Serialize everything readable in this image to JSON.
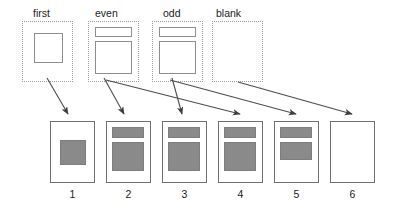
{
  "diagram": {
    "colors": {
      "block_fill": "#8a8a8a",
      "block_stroke": "#7d7d7d",
      "page_stroke": "#6f6f6f",
      "template_stroke": "#9a9a9a",
      "arrow": "#4d4d4d",
      "background": "#ffffff",
      "text": "#1a1a1a"
    },
    "templates": [
      {
        "id": "first",
        "label": "first",
        "label_x": 33,
        "label_y": 7,
        "box": {
          "x": 22,
          "y": 21,
          "w": 51,
          "h": 61
        },
        "has_header_bar": false,
        "body": {
          "x": 34,
          "y": 33,
          "w": 29,
          "h": 30
        }
      },
      {
        "id": "even",
        "label": "even",
        "label_x": 95,
        "label_y": 7,
        "box": {
          "x": 88,
          "y": 21,
          "w": 51,
          "h": 61
        },
        "has_header_bar": true,
        "header": {
          "x": 95,
          "y": 27,
          "w": 37,
          "h": 10
        },
        "body": {
          "x": 95,
          "y": 41,
          "w": 37,
          "h": 33
        }
      },
      {
        "id": "odd",
        "label": "odd",
        "label_x": 163,
        "label_y": 7,
        "box": {
          "x": 152,
          "y": 21,
          "w": 51,
          "h": 61
        },
        "has_header_bar": true,
        "header": {
          "x": 159,
          "y": 27,
          "w": 37,
          "h": 10
        },
        "body": {
          "x": 159,
          "y": 41,
          "w": 37,
          "h": 33
        }
      },
      {
        "id": "blank",
        "label": "blank",
        "label_x": 216,
        "label_y": 7,
        "box": {
          "x": 212,
          "y": 21,
          "w": 51,
          "h": 61
        },
        "has_header_bar": false,
        "body": null
      }
    ],
    "pages": [
      {
        "number": "1",
        "box": {
          "x": 50,
          "y": 121,
          "w": 45,
          "h": 62
        },
        "blocks": [
          {
            "x": 60,
            "y": 140,
            "w": 26,
            "h": 25
          }
        ]
      },
      {
        "number": "2",
        "box": {
          "x": 106,
          "y": 121,
          "w": 45,
          "h": 62
        },
        "blocks": [
          {
            "x": 112,
            "y": 127,
            "w": 32,
            "h": 11
          },
          {
            "x": 112,
            "y": 142,
            "w": 32,
            "h": 29
          }
        ]
      },
      {
        "number": "3",
        "box": {
          "x": 162,
          "y": 121,
          "w": 45,
          "h": 62
        },
        "blocks": [
          {
            "x": 168,
            "y": 127,
            "w": 32,
            "h": 11
          },
          {
            "x": 168,
            "y": 142,
            "w": 32,
            "h": 29
          }
        ]
      },
      {
        "number": "4",
        "box": {
          "x": 218,
          "y": 121,
          "w": 45,
          "h": 62
        },
        "blocks": [
          {
            "x": 224,
            "y": 127,
            "w": 32,
            "h": 11
          },
          {
            "x": 224,
            "y": 142,
            "w": 32,
            "h": 29
          }
        ]
      },
      {
        "number": "5",
        "box": {
          "x": 274,
          "y": 121,
          "w": 45,
          "h": 62
        },
        "blocks": [
          {
            "x": 280,
            "y": 127,
            "w": 32,
            "h": 11
          },
          {
            "x": 280,
            "y": 142,
            "w": 32,
            "h": 18
          }
        ]
      },
      {
        "number": "6",
        "box": {
          "x": 330,
          "y": 121,
          "w": 45,
          "h": 62
        },
        "blocks": []
      }
    ],
    "arrows": [
      {
        "id": "first-to-1",
        "from": "first",
        "to": "1",
        "x1": 47,
        "y1": 78,
        "x2": 68,
        "y2": 114
      },
      {
        "id": "even-to-2",
        "from": "even",
        "to": "2",
        "x1": 104,
        "y1": 78,
        "x2": 124,
        "y2": 114
      },
      {
        "id": "odd-to-3",
        "from": "odd",
        "to": "3",
        "x1": 172,
        "y1": 78,
        "x2": 182,
        "y2": 114
      },
      {
        "id": "even-to-4",
        "from": "even",
        "to": "4",
        "x1": 106,
        "y1": 80,
        "x2": 240,
        "y2": 114
      },
      {
        "id": "odd-to-5",
        "from": "odd",
        "to": "5",
        "x1": 170,
        "y1": 80,
        "x2": 296,
        "y2": 114
      },
      {
        "id": "blank-to-6",
        "from": "blank",
        "to": "6",
        "x1": 238,
        "y1": 82,
        "x2": 352,
        "y2": 114
      }
    ]
  }
}
